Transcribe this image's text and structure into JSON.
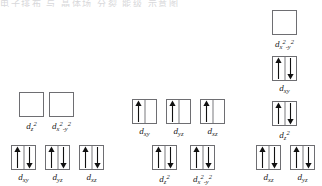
{
  "page": {
    "background_color": "#ffffff",
    "box_border_color": "#6e6e72",
    "arrow_color": "#111111",
    "top_strip_text": "电子排布 与 晶体场 分裂 能级 示意图"
  },
  "diagram": {
    "groups": [
      {
        "name": "left-group",
        "levels": [
          {
            "name": "upper-level",
            "orbitals": [
              {
                "label_html": "d<sub>z</sub><sup>2</sup>",
                "label_text": "dz2",
                "electrons": "empty",
                "x": 19,
                "y": 92
              },
              {
                "label_html": "d<sub>x</sub><sup>2</sup><sub>-y</sub><sup>2</sup>",
                "label_text": "dx2-y2",
                "electrons": "empty",
                "x": 49,
                "y": 92
              }
            ]
          },
          {
            "name": "lower-level",
            "orbitals": [
              {
                "label_html": "d<sub>xy</sub>",
                "label_text": "dxy",
                "electrons": "paired",
                "x": 11,
                "y": 145
              },
              {
                "label_html": "d<sub>yz</sub>",
                "label_text": "dyz",
                "electrons": "paired",
                "x": 45,
                "y": 145
              },
              {
                "label_html": "d<sub>xz</sub>",
                "label_text": "dxz",
                "electrons": "paired",
                "x": 79,
                "y": 145
              }
            ]
          }
        ]
      },
      {
        "name": "middle-group",
        "levels": [
          {
            "name": "upper-level",
            "orbitals": [
              {
                "label_html": "d<sub>xy</sub>",
                "label_text": "dxy",
                "electrons": "single",
                "x": 132,
                "y": 99
              },
              {
                "label_html": "d<sub>yz</sub>",
                "label_text": "dyz",
                "electrons": "single",
                "x": 166,
                "y": 99
              },
              {
                "label_html": "d<sub>xz</sub>",
                "label_text": "dxz",
                "electrons": "single",
                "x": 200,
                "y": 99
              }
            ]
          },
          {
            "name": "lower-level",
            "orbitals": [
              {
                "label_html": "d<sub>z</sub><sup>2</sup>",
                "label_text": "dz2",
                "electrons": "paired",
                "x": 152,
                "y": 145
              },
              {
                "label_html": "d<sub>x</sub><sup>2</sup><sub>-y</sub><sup>2</sup>",
                "label_text": "dx2-y2",
                "electrons": "paired",
                "x": 190,
                "y": 145
              }
            ]
          }
        ]
      },
      {
        "name": "right-group",
        "levels": [
          {
            "name": "level-1",
            "orbitals": [
              {
                "label_html": "d<sub>x</sub><sup>2</sup><sub>-y</sub><sup>2</sup>",
                "label_text": "dx2-y2",
                "electrons": "empty",
                "x": 272,
                "y": 10
              }
            ]
          },
          {
            "name": "level-2",
            "orbitals": [
              {
                "label_html": "d<sub>xy</sub>",
                "label_text": "dxy",
                "electrons": "paired",
                "x": 272,
                "y": 56
              }
            ]
          },
          {
            "name": "level-3",
            "orbitals": [
              {
                "label_html": "d<sub>z</sub><sup>2</sup>",
                "label_text": "dz2",
                "electrons": "paired",
                "x": 272,
                "y": 101
              }
            ]
          },
          {
            "name": "level-4",
            "orbitals": [
              {
                "label_html": "d<sub>xz</sub>",
                "label_text": "dxz",
                "electrons": "paired",
                "x": 256,
                "y": 145
              },
              {
                "label_html": "d<sub>yz</sub>",
                "label_text": "dyz",
                "electrons": "paired",
                "x": 290,
                "y": 145
              }
            ]
          }
        ]
      }
    ]
  }
}
